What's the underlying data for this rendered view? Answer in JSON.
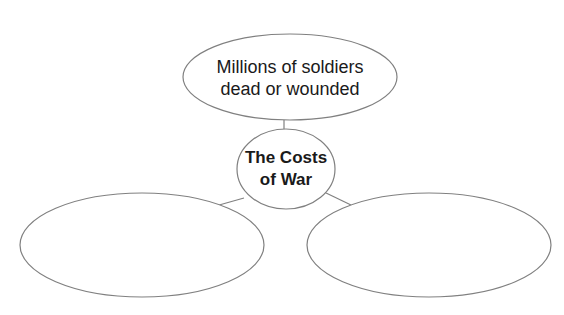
{
  "diagram": {
    "type": "concept-web",
    "center": {
      "lines": [
        "The Costs",
        "of War"
      ]
    },
    "branches": [
      {
        "position": "top",
        "lines": [
          "Millions of soldiers",
          "dead or wounded"
        ]
      },
      {
        "position": "bottom-left",
        "lines": []
      },
      {
        "position": "bottom-right",
        "lines": []
      }
    ],
    "colors": {
      "stroke": "#808080",
      "text": "#1a1a1a",
      "background": "#ffffff"
    }
  }
}
